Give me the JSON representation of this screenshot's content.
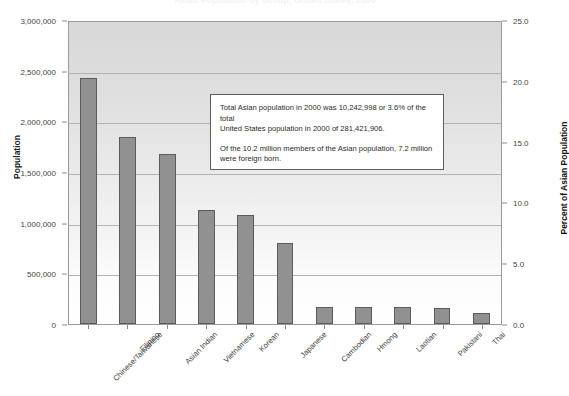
{
  "chart_data": {
    "type": "bar",
    "title": "Asian Population by Group, United States, 2000",
    "xlabel": "",
    "ylabel": "Population",
    "y2label": "Percent of Asian Population",
    "categories": [
      "Chinese/Taiwanese",
      "Filipino",
      "Asian Indian",
      "Vietnamese",
      "Korean",
      "Japanese",
      "Cambodian",
      "Hmong",
      "Laotian",
      "Pakistani",
      "Thai"
    ],
    "values": [
      2432585,
      1850314,
      1678765,
      1122528,
      1076872,
      796700,
      171937,
      169428,
      168707,
      153533,
      112989
    ],
    "percent_values": [
      23.7,
      18.1,
      16.4,
      11.0,
      10.5,
      7.8,
      1.7,
      1.7,
      1.6,
      1.5,
      1.1
    ],
    "ylim": [
      0,
      3000000
    ],
    "y2lim": [
      0,
      25.0
    ],
    "yticks": [
      0,
      500000,
      1000000,
      1500000,
      2000000,
      2500000,
      3000000
    ],
    "ytick_labels": [
      "0",
      "500,000",
      "1,000,000",
      "1,500,000",
      "2,000,000",
      "2,500,000",
      "3,000,000"
    ],
    "y2ticks": [
      0,
      5,
      10,
      15,
      20,
      25
    ],
    "y2tick_labels": [
      "0.0",
      "5.0",
      "10.0",
      "15.0",
      "20.0",
      "25.0"
    ],
    "grid": true,
    "legend": "none",
    "bar_color": "#919191",
    "bar_border_color": "#5b5b5b",
    "plot_bg_top": "#d8d8d8",
    "plot_bg_bottom": "#ffffff",
    "annotations": [
      {
        "line1": "Total Asian population in 2000 was 10,242,998 or 3.6% of the total",
        "line2": "United States population in 2000 of 281,421,906.",
        "line3": "Of the 10.2 million members of the Asian population, 7.2 million",
        "line4": "were foreign born."
      }
    ]
  }
}
